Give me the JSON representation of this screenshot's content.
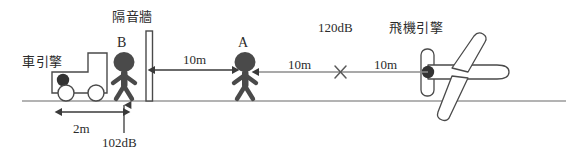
{
  "diagram": {
    "title_hidden": "",
    "labels": {
      "car_engine": "車引擎",
      "sound_wall": "隔音牆",
      "person_b": "B",
      "person_a": "A",
      "plane_engine": "飛機引擎",
      "level_plane": "120dB",
      "level_b": "102dB"
    },
    "dimensions": {
      "car_to_b": "2m",
      "b_to_a": "10m",
      "a_to_x": "10m",
      "x_to_plane": "10m"
    },
    "colors": {
      "figure_fill": "#4a4a4a",
      "line": "#808080",
      "outline": "#4a4a4a",
      "text": "#2b2b2b",
      "background": "#ffffff"
    },
    "icons": {
      "person": "person-figure-icon",
      "truck": "truck-icon",
      "airplane": "airplane-icon",
      "wall": "wall-icon",
      "cross": "cross-mark-icon",
      "source_dot": "sound-source-dot-icon"
    }
  }
}
